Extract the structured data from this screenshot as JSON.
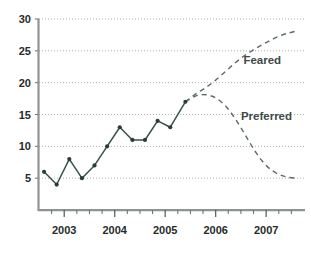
{
  "chart_data": {
    "type": "line",
    "title": "",
    "xlabel": "",
    "ylabel": "",
    "xlim": [
      2002.5,
      2007.75
    ],
    "ylim": [
      0,
      30
    ],
    "grid": true,
    "legend_position": "inline-annotation",
    "y_ticks": [
      5,
      10,
      15,
      20,
      25,
      30
    ],
    "y_tick_labels": [
      "5",
      "10",
      "15",
      "20",
      "25",
      "30"
    ],
    "x_ticks": [
      2003,
      2004,
      2005,
      2006,
      2007
    ],
    "x_tick_labels": [
      "2003",
      "2004",
      "2005",
      "2006",
      "2007"
    ],
    "x_minor_ticks": [
      2002.75,
      2003.25,
      2003.5,
      2003.75,
      2004.25,
      2004.5,
      2004.75,
      2005.25,
      2005.5,
      2005.75,
      2006.25,
      2006.5,
      2006.75,
      2007.25,
      2007.5
    ],
    "series": [
      {
        "name": "Actual",
        "style": "solid",
        "markers": true,
        "color": "#36514c",
        "x": [
          2002.6,
          2002.85,
          2003.1,
          2003.35,
          2003.6,
          2003.85,
          2004.1,
          2004.35,
          2004.6,
          2004.85,
          2005.1,
          2005.4
        ],
        "values": [
          6,
          4,
          8,
          5,
          7,
          10,
          13,
          11,
          11,
          14,
          13,
          17
        ]
      },
      {
        "name": "Feared",
        "style": "dashed",
        "markers": false,
        "color": "#5c6c68",
        "x": [
          2005.4,
          2005.6,
          2005.8,
          2006.0,
          2006.2,
          2006.4,
          2006.6,
          2006.8,
          2007.0,
          2007.2,
          2007.4,
          2007.6
        ],
        "values": [
          17,
          18.2,
          19.2,
          20.4,
          21.8,
          23.2,
          24.4,
          25.4,
          26.3,
          27.1,
          27.7,
          28.1
        ]
      },
      {
        "name": "Preferred",
        "style": "dashed",
        "markers": false,
        "color": "#5c6c68",
        "x": [
          2005.4,
          2005.6,
          2005.8,
          2006.0,
          2006.2,
          2006.4,
          2006.6,
          2006.8,
          2007.0,
          2007.2,
          2007.4,
          2007.6
        ],
        "values": [
          17,
          17.9,
          18.1,
          17.6,
          16.3,
          14.2,
          11.6,
          9.0,
          7.0,
          5.8,
          5.2,
          5.0
        ]
      }
    ],
    "annotations": [
      {
        "text": "Feared",
        "x": 2006.55,
        "y": 23.0
      },
      {
        "text": "Preferred",
        "x": 2006.5,
        "y": 14.1
      }
    ]
  },
  "colors": {
    "actual_line": "#36514c",
    "forecast_line": "#5c6c68",
    "gridline": "#9a9a9a",
    "axis": "#8e9494",
    "text": "#262b2b",
    "annotation_text": "#3c4a48",
    "background": "#ffffff"
  }
}
